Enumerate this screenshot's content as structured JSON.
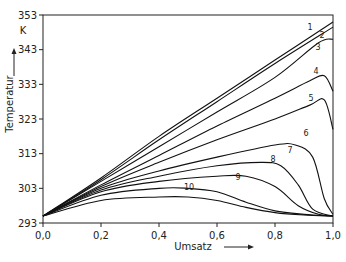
{
  "chart_data": {
    "type": "line",
    "title": "",
    "xlabel": "Umsatz",
    "ylabel": "Temperatur",
    "yunit": "K",
    "xlim": [
      0.0,
      1.0
    ],
    "ylim": [
      293,
      353
    ],
    "xticks": [
      "0,0",
      "0,2",
      "0,4",
      "0,6",
      "0,8",
      "1,0"
    ],
    "yticks": [
      "293",
      "303",
      "313",
      "323",
      "333",
      "343",
      "353"
    ],
    "grid": false,
    "legend": "inline curve numbers",
    "series": [
      {
        "name": "1",
        "x": [
          0,
          0.2,
          0.4,
          0.6,
          0.8,
          1.0
        ],
        "y": [
          295,
          306,
          318,
          329,
          340,
          351
        ]
      },
      {
        "name": "2",
        "x": [
          0,
          0.2,
          0.4,
          0.6,
          0.8,
          1.0
        ],
        "y": [
          295,
          305.5,
          317,
          328,
          339,
          349.5
        ]
      },
      {
        "name": "3",
        "x": [
          0,
          0.2,
          0.4,
          0.6,
          0.8,
          0.95,
          1.0
        ],
        "y": [
          295,
          305,
          315,
          325,
          335,
          345,
          346
        ]
      },
      {
        "name": "4",
        "x": [
          0,
          0.2,
          0.4,
          0.6,
          0.8,
          0.92,
          0.97,
          1.0
        ],
        "y": [
          295,
          304,
          312.5,
          321,
          329,
          334,
          335.5,
          331
        ]
      },
      {
        "name": "5",
        "x": [
          0,
          0.2,
          0.4,
          0.6,
          0.8,
          0.92,
          0.97,
          1.0
        ],
        "y": [
          295,
          303.5,
          310.5,
          317,
          323,
          327,
          328.5,
          320
        ]
      },
      {
        "name": "6",
        "x": [
          0,
          0.2,
          0.4,
          0.6,
          0.8,
          0.87,
          0.93,
          0.97,
          1.0
        ],
        "y": [
          295,
          303,
          308,
          312,
          315.5,
          315.5,
          312,
          300,
          295.5
        ]
      },
      {
        "name": "7",
        "x": [
          0,
          0.2,
          0.4,
          0.6,
          0.75,
          0.82,
          0.88,
          0.93,
          1.0
        ],
        "y": [
          295,
          302.5,
          306.5,
          309.5,
          310.5,
          309.5,
          304,
          297,
          295
        ]
      },
      {
        "name": "8",
        "x": [
          0,
          0.2,
          0.4,
          0.6,
          0.7,
          0.8,
          0.88,
          0.95,
          1.0
        ],
        "y": [
          295,
          302,
          305,
          306.5,
          306.5,
          303.5,
          298,
          295.5,
          295
        ]
      },
      {
        "name": "9",
        "x": [
          0,
          0.2,
          0.4,
          0.5,
          0.6,
          0.7,
          0.8,
          0.9,
          1.0
        ],
        "y": [
          295,
          301,
          303,
          303,
          302,
          299,
          296.5,
          295.5,
          295
        ]
      },
      {
        "name": "10",
        "x": [
          0,
          0.2,
          0.4,
          0.5,
          0.6,
          0.7,
          0.8,
          0.9,
          1.0
        ],
        "y": [
          295,
          299.5,
          300.5,
          300.5,
          299.5,
          297.5,
          296,
          295.3,
          295
        ]
      }
    ]
  }
}
